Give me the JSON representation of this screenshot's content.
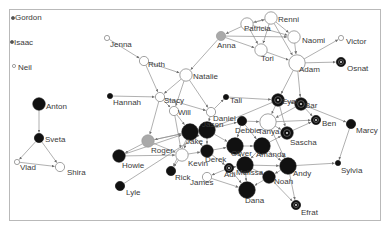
{
  "diagram": {
    "type": "network-graph",
    "directed": true,
    "colors": {
      "white": "#ffffff",
      "gray": "#a9a9a9",
      "black": "#111111",
      "outline": "#7a7a7a",
      "edge": "#8e8e8e"
    },
    "nodes": [
      {
        "id": "Gordon",
        "label": "Gordon",
        "style": "dot",
        "size": "tiny"
      },
      {
        "id": "Isaac",
        "label": "Isaac",
        "style": "dot",
        "size": "tiny"
      },
      {
        "id": "Neil",
        "label": "Neil",
        "style": "white",
        "size": "tiny"
      },
      {
        "id": "Anton",
        "label": "Anton",
        "style": "black",
        "size": "large"
      },
      {
        "id": "Sveta",
        "label": "Sveta",
        "style": "black",
        "size": "medium"
      },
      {
        "id": "Vlad",
        "label": "Vlad",
        "style": "white",
        "size": "small"
      },
      {
        "id": "Shira",
        "label": "Shira",
        "style": "white",
        "size": "medium"
      },
      {
        "id": "Jenna",
        "label": "Jenna",
        "style": "white",
        "size": "small"
      },
      {
        "id": "Ruth",
        "label": "Ruth",
        "style": "white",
        "size": "medium"
      },
      {
        "id": "Natalie",
        "label": "Natalie",
        "style": "white",
        "size": "large"
      },
      {
        "id": "Hannah",
        "label": "Hannah",
        "style": "black",
        "size": "small"
      },
      {
        "id": "Stacy",
        "label": "Stacy",
        "style": "white",
        "size": "medium"
      },
      {
        "id": "Will",
        "label": "Will",
        "style": "white",
        "size": "medium"
      },
      {
        "id": "Anna",
        "label": "Anna",
        "style": "gray",
        "size": "medium"
      },
      {
        "id": "Patricia",
        "label": "Patricia",
        "style": "white",
        "size": "large"
      },
      {
        "id": "Renni",
        "label": "Renni",
        "style": "white",
        "size": "large"
      },
      {
        "id": "Naomi",
        "label": "Naomi",
        "style": "white",
        "size": "large"
      },
      {
        "id": "Tori",
        "label": "Tori",
        "style": "white",
        "size": "large"
      },
      {
        "id": "Adam",
        "label": "Adam",
        "style": "white",
        "size": "xlarge"
      },
      {
        "id": "Victor",
        "label": "Victor",
        "style": "white",
        "size": "small"
      },
      {
        "id": "Osnat",
        "label": "Osnat",
        "style": "ring",
        "size": "medium"
      },
      {
        "id": "Tali",
        "label": "Tali",
        "style": "black",
        "size": "small"
      },
      {
        "id": "Daniel",
        "label": "Daniel",
        "style": "white",
        "size": "medium"
      },
      {
        "id": "Eyal",
        "label": "Eyal",
        "style": "ring",
        "size": "large"
      },
      {
        "id": "Bar",
        "label": "Bar",
        "style": "ring",
        "size": "large"
      },
      {
        "id": "Ben",
        "label": "Ben",
        "style": "ring",
        "size": "medium"
      },
      {
        "id": "Marcy",
        "label": "Marcy",
        "style": "black",
        "size": "medium"
      },
      {
        "id": "Roger",
        "label": "Roger",
        "style": "gray",
        "size": "large"
      },
      {
        "id": "Jake",
        "label": "Jake",
        "style": "black",
        "size": "xlarge"
      },
      {
        "id": "Jason",
        "label": "Jason",
        "style": "black",
        "size": "xlarge"
      },
      {
        "id": "Debbie",
        "label": "Debbie",
        "style": "black",
        "size": "medium"
      },
      {
        "id": "Tanya",
        "label": "Tanya",
        "style": "white",
        "size": "xlarge"
      },
      {
        "id": "Sascha",
        "label": "Sascha",
        "style": "ring",
        "size": "large"
      },
      {
        "id": "Howie",
        "label": "Howie",
        "style": "black",
        "size": "large"
      },
      {
        "id": "Kevin",
        "label": "Kevin",
        "style": "white",
        "size": "large"
      },
      {
        "id": "Derek",
        "label": "Derek",
        "style": "black",
        "size": "large"
      },
      {
        "id": "Oliver",
        "label": "Oliver",
        "style": "black",
        "size": "xlarge"
      },
      {
        "id": "Amanda",
        "label": "Amanda",
        "style": "black",
        "size": "xlarge"
      },
      {
        "id": "Rick",
        "label": "Rick",
        "style": "black",
        "size": "medium"
      },
      {
        "id": "Adi",
        "label": "Adi",
        "style": "ring",
        "size": "medium"
      },
      {
        "id": "James",
        "label": "James",
        "style": "white",
        "size": "medium"
      },
      {
        "id": "Melissa",
        "label": "Melissa",
        "style": "black",
        "size": "xlarge"
      },
      {
        "id": "Andy",
        "label": "Andy",
        "style": "black",
        "size": "xlarge"
      },
      {
        "id": "Noah",
        "label": "Noah",
        "style": "black",
        "size": "large"
      },
      {
        "id": "Sylvia",
        "label": "Sylvia",
        "style": "black",
        "size": "small"
      },
      {
        "id": "Dana",
        "label": "Dana",
        "style": "black",
        "size": "xlarge"
      },
      {
        "id": "Efrat",
        "label": "Efrat",
        "style": "ring",
        "size": "medium"
      },
      {
        "id": "Lyle",
        "label": "Lyle",
        "style": "black",
        "size": "medium"
      }
    ],
    "edges": [
      [
        "Anton",
        "Sveta"
      ],
      [
        "Sveta",
        "Vlad"
      ],
      [
        "Sveta",
        "Shira"
      ],
      [
        "Vlad",
        "Shira"
      ],
      [
        "Jenna",
        "Ruth"
      ],
      [
        "Ruth",
        "Natalie"
      ],
      [
        "Ruth",
        "Stacy"
      ],
      [
        "Anna",
        "Natalie"
      ],
      [
        "Natalie",
        "Stacy"
      ],
      [
        "Natalie",
        "Daniel"
      ],
      [
        "Natalie",
        "Will"
      ],
      [
        "Hannah",
        "Stacy"
      ],
      [
        "Stacy",
        "Will"
      ],
      [
        "Stacy",
        "Daniel"
      ],
      [
        "Stacy",
        "Roger"
      ],
      [
        "Patricia",
        "Anna"
      ],
      [
        "Renni",
        "Patricia"
      ],
      [
        "Patricia",
        "Renni"
      ],
      [
        "Patricia",
        "Naomi"
      ],
      [
        "Patricia",
        "Tori"
      ],
      [
        "Anna",
        "Tori"
      ],
      [
        "Renni",
        "Naomi"
      ],
      [
        "Renni",
        "Tori"
      ],
      [
        "Renni",
        "Adam"
      ],
      [
        "Naomi",
        "Adam"
      ],
      [
        "Tori",
        "Adam"
      ],
      [
        "Anna",
        "Naomi"
      ],
      [
        "Adam",
        "Victor"
      ],
      [
        "Adam",
        "Osnat"
      ],
      [
        "Adam",
        "Eyal"
      ],
      [
        "Adam",
        "Bar"
      ],
      [
        "Tali",
        "Eyal"
      ],
      [
        "Daniel",
        "Tali"
      ],
      [
        "Eyal",
        "Bar"
      ],
      [
        "Eyal",
        "Tanya"
      ],
      [
        "Eyal",
        "Sascha"
      ],
      [
        "Eyal",
        "Jason"
      ],
      [
        "Bar",
        "Ben"
      ],
      [
        "Bar",
        "Marcy"
      ],
      [
        "Bar",
        "Tanya"
      ],
      [
        "Tanya",
        "Ben"
      ],
      [
        "Tanya",
        "Sascha"
      ],
      [
        "Sascha",
        "Ben"
      ],
      [
        "Marcy",
        "Sylvia"
      ],
      [
        "Roger",
        "Jake"
      ],
      [
        "Jake",
        "Roger"
      ],
      [
        "Roger",
        "Howie"
      ],
      [
        "Roger",
        "Kevin"
      ],
      [
        "Jake",
        "Jason"
      ],
      [
        "Jason",
        "Debbie"
      ],
      [
        "Jake",
        "Derek"
      ],
      [
        "Jake",
        "Kevin"
      ],
      [
        "Will",
        "Jake"
      ],
      [
        "Will",
        "Kevin"
      ],
      [
        "Howie",
        "Jake"
      ],
      [
        "Howie",
        "Kevin"
      ],
      [
        "Lyle",
        "Jason"
      ],
      [
        "Kevin",
        "Rick"
      ],
      [
        "Jake",
        "Rick"
      ],
      [
        "Debbie",
        "Tanya"
      ],
      [
        "Debbie",
        "Oliver"
      ],
      [
        "Jason",
        "Oliver"
      ],
      [
        "Derek",
        "Oliver"
      ],
      [
        "Oliver",
        "Amanda"
      ],
      [
        "Amanda",
        "Sascha"
      ],
      [
        "Amanda",
        "Andy"
      ],
      [
        "Amanda",
        "Melissa"
      ],
      [
        "Oliver",
        "Melissa"
      ],
      [
        "Derek",
        "Adi"
      ],
      [
        "Adi",
        "Melissa"
      ],
      [
        "Adi",
        "Dana"
      ],
      [
        "Adi",
        "James"
      ],
      [
        "Melissa",
        "Dana"
      ],
      [
        "Melissa",
        "Noah"
      ],
      [
        "Andy",
        "Noah"
      ],
      [
        "Andy",
        "Sylvia"
      ],
      [
        "Andy",
        "Efrat"
      ],
      [
        "Noah",
        "Efrat"
      ],
      [
        "Noah",
        "Dana"
      ],
      [
        "Melissa",
        "Andy"
      ],
      [
        "Debbie",
        "Amanda"
      ],
      [
        "Kevin",
        "Derek"
      ],
      [
        "James",
        "Dana"
      ],
      [
        "Tanya",
        "Andy"
      ],
      [
        "Jason",
        "Derek"
      ],
      [
        "Daniel",
        "Jason"
      ]
    ]
  }
}
